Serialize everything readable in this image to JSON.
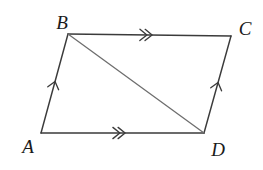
{
  "figure": {
    "type": "geometry-diagram",
    "canvas": {
      "width": 263,
      "height": 170,
      "background": "#ffffff"
    },
    "colors": {
      "edge": "#3b3b3b",
      "diagonal": "#6e6e6e",
      "label": "#1a1a1a",
      "background": "#ffffff"
    },
    "vertices": [
      {
        "id": "A",
        "label": "A",
        "x": 41,
        "y": 133,
        "label_x": 28,
        "label_y": 153
      },
      {
        "id": "B",
        "label": "B",
        "x": 68,
        "y": 34,
        "label_x": 62,
        "label_y": 29
      },
      {
        "id": "C",
        "label": "C",
        "x": 231,
        "y": 36,
        "label_x": 245,
        "label_y": 35
      },
      {
        "id": "D",
        "label": "D",
        "x": 204,
        "y": 133,
        "label_x": 218,
        "label_y": 156
      }
    ],
    "edges": [
      {
        "id": "AB",
        "from": "A",
        "to": "B",
        "style": "solid",
        "kind": "side"
      },
      {
        "id": "BC",
        "from": "B",
        "to": "C",
        "style": "solid",
        "kind": "side"
      },
      {
        "id": "CD",
        "from": "C",
        "to": "D",
        "style": "solid",
        "kind": "side"
      },
      {
        "id": "DA",
        "from": "D",
        "to": "A",
        "style": "solid",
        "kind": "side"
      },
      {
        "id": "BD",
        "from": "B",
        "to": "D",
        "style": "solid",
        "kind": "diagonal"
      }
    ],
    "arrow_marks": [
      {
        "id": "AB-mark",
        "edge": "AB",
        "count": 1,
        "t": 0.52,
        "direction": "toward-B"
      },
      {
        "id": "DC-mark",
        "edge": "CD",
        "count": 1,
        "t": 0.52,
        "direction": "toward-C"
      },
      {
        "id": "BC-mark",
        "edge": "BC",
        "count": 2,
        "t": 0.5,
        "direction": "toward-C"
      },
      {
        "id": "AD-mark",
        "edge": "DA",
        "count": 2,
        "t": 0.5,
        "direction": "toward-D"
      }
    ]
  }
}
